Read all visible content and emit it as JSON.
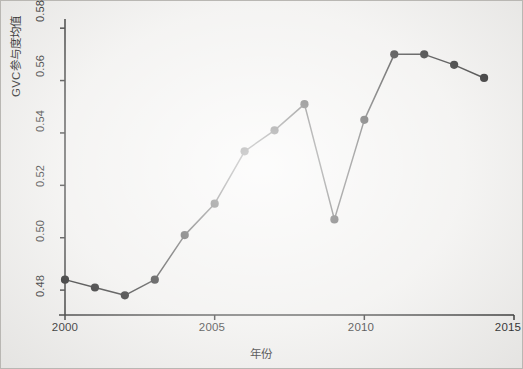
{
  "chart_data": {
    "type": "line",
    "title": "",
    "subtitle": "",
    "xlabel": "年份",
    "ylabel": "GVC参与度均值",
    "x": [
      2000,
      2001,
      2002,
      2003,
      2004,
      2005,
      2006,
      2007,
      2008,
      2009,
      2010,
      2011,
      2012,
      2013,
      2014
    ],
    "values": [
      0.484,
      0.481,
      0.478,
      0.484,
      0.501,
      0.513,
      0.533,
      0.541,
      0.551,
      0.507,
      0.545,
      0.57,
      0.57,
      0.566,
      0.561
    ],
    "series": [
      {
        "name": "GVC参与度均值",
        "values": [
          0.484,
          0.481,
          0.478,
          0.484,
          0.501,
          0.513,
          0.533,
          0.541,
          0.551,
          0.507,
          0.545,
          0.57,
          0.57,
          0.566,
          0.561
        ]
      }
    ],
    "xlim": [
      2000,
      2015
    ],
    "ylim": [
      0.4705,
      0.5835
    ],
    "xticks": [
      2000,
      2005,
      2010,
      2015
    ],
    "xtick_labels": [
      "2000",
      "2005",
      "2010",
      "2015"
    ],
    "yticks": [
      0.48,
      0.5,
      0.52,
      0.54,
      0.56,
      0.58
    ],
    "ytick_labels": [
      "0.48",
      "0.50",
      "0.52",
      "0.54",
      "0.56",
      "0.58"
    ],
    "grid": false,
    "legend": false,
    "legend_position": "none",
    "marker": "filled-circle",
    "line_color": "#242424",
    "marker_color": "#111111",
    "axis_color": "#2a2a2a",
    "background_color": "#efeeec",
    "annotations": []
  },
  "figure": {
    "frame_label": "chart-frame",
    "y_axis_name": "y-axis",
    "x_axis_name": "x-axis"
  }
}
